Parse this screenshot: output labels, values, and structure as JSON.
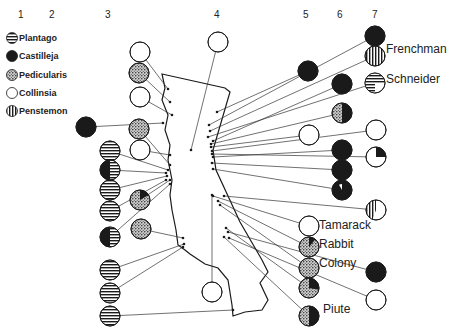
{
  "column_numbers": [
    {
      "label": "1",
      "x": 18,
      "y": 9
    },
    {
      "label": "2",
      "x": 49,
      "y": 9
    },
    {
      "label": "3",
      "x": 105,
      "y": 9
    },
    {
      "label": "4",
      "x": 214,
      "y": 9
    },
    {
      "label": "5",
      "x": 303,
      "y": 9
    },
    {
      "label": "6",
      "x": 337,
      "y": 9
    },
    {
      "label": "7",
      "x": 372,
      "y": 9
    }
  ],
  "legend": [
    {
      "label": "Plantago",
      "pattern": "hlines",
      "y": 34
    },
    {
      "label": "Castilleja",
      "pattern": "solid",
      "y": 52
    },
    {
      "label": "Pedicularis",
      "pattern": "dots",
      "y": 71
    },
    {
      "label": "Collinsia",
      "pattern": "empty",
      "y": 89
    },
    {
      "label": "Penstemon",
      "pattern": "vlines",
      "y": 107
    }
  ],
  "site_labels": [
    {
      "label": "Frenchman",
      "x": 386,
      "y": 50
    },
    {
      "label": "Schneider",
      "x": 386,
      "y": 80
    },
    {
      "label": "Tamarack",
      "x": 319,
      "y": 226
    },
    {
      "label": "Rabbit",
      "x": 319,
      "y": 245
    },
    {
      "label": "Colony",
      "x": 319,
      "y": 264
    },
    {
      "label": "Piute",
      "x": 323,
      "y": 310
    }
  ],
  "colors": {
    "ink": "#1a1a1a",
    "paper": "#ffffff"
  },
  "circles": [
    {
      "id": "c1-1",
      "cx": 86,
      "cy": 127,
      "r": 10,
      "pattern": "solid",
      "target": [
        163,
        123
      ]
    },
    {
      "id": "c3-1",
      "cx": 140,
      "cy": 52,
      "r": 10,
      "pattern": "empty",
      "target": [
        168,
        89
      ]
    },
    {
      "id": "c3-2",
      "cx": 139,
      "cy": 73,
      "r": 10,
      "pattern": "dots",
      "target": [
        170,
        102
      ]
    },
    {
      "id": "c3-3",
      "cx": 140,
      "cy": 97,
      "r": 10,
      "pattern": "empty",
      "target": [
        172,
        115
      ]
    },
    {
      "id": "c3-4",
      "cx": 139,
      "cy": 129,
      "r": 10,
      "pattern": "dots",
      "target": [
        170,
        165
      ]
    },
    {
      "id": "c3-5",
      "cx": 140,
      "cy": 150,
      "r": 10,
      "pattern": "empty",
      "target": [
        170,
        155
      ]
    },
    {
      "id": "c3-6",
      "cx": 140,
      "cy": 200,
      "r": 10,
      "pattern": "dots_wedge",
      "target": [
        170,
        180
      ]
    },
    {
      "id": "c3-7",
      "cx": 141,
      "cy": 229,
      "r": 10,
      "pattern": "dots",
      "target": [
        183,
        238
      ]
    },
    {
      "id": "c2-1",
      "cx": 110,
      "cy": 151,
      "r": 10,
      "pattern": "hlines",
      "target": [
        168,
        170
      ]
    },
    {
      "id": "c2-2",
      "cx": 110,
      "cy": 170,
      "r": 10,
      "pattern": "solid_hlines",
      "target": [
        166,
        173
      ]
    },
    {
      "id": "c2-3",
      "cx": 110,
      "cy": 190,
      "r": 10,
      "pattern": "hlines",
      "target": [
        167,
        176
      ]
    },
    {
      "id": "c2-4",
      "cx": 110,
      "cy": 211,
      "r": 10,
      "pattern": "hlines",
      "target": [
        166,
        180
      ]
    },
    {
      "id": "c2-5",
      "cx": 110,
      "cy": 237,
      "r": 10,
      "pattern": "solid_quarter_hlines",
      "target": [
        170,
        184
      ]
    },
    {
      "id": "c2-6",
      "cx": 110,
      "cy": 270,
      "r": 10,
      "pattern": "hlines",
      "target": [
        184,
        244
      ]
    },
    {
      "id": "c2-7",
      "cx": 110,
      "cy": 293,
      "r": 10,
      "pattern": "hlines",
      "target": [
        183,
        247
      ]
    },
    {
      "id": "c2-8",
      "cx": 110,
      "cy": 316,
      "r": 10,
      "pattern": "hlines",
      "target": [
        233,
        310
      ]
    },
    {
      "id": "c4-1",
      "cx": 218,
      "cy": 42,
      "r": 10,
      "pattern": "empty",
      "target": [
        191,
        150
      ]
    },
    {
      "id": "c4-2",
      "cx": 212,
      "cy": 292,
      "r": 10,
      "pattern": "empty",
      "target": [
        212,
        195
      ]
    },
    {
      "id": "c5-1",
      "cx": 308,
      "cy": 71,
      "r": 10,
      "pattern": "solid",
      "target": [
        217,
        112
      ]
    },
    {
      "id": "c5-2",
      "cx": 309,
      "cy": 135,
      "r": 10,
      "pattern": "empty",
      "target": [
        211,
        147
      ]
    },
    {
      "id": "c5-3",
      "cx": 309,
      "cy": 226,
      "r": 10,
      "pattern": "empty",
      "target": [
        213,
        196
      ]
    },
    {
      "id": "c5-4",
      "cx": 309,
      "cy": 247,
      "r": 10,
      "pattern": "dots_wedge_small",
      "target": [
        218,
        201
      ]
    },
    {
      "id": "c5-5",
      "cx": 309,
      "cy": 268,
      "r": 10,
      "pattern": "dots",
      "target": [
        220,
        205
      ]
    },
    {
      "id": "c5-6",
      "cx": 309,
      "cy": 288,
      "r": 10,
      "pattern": "dots_solid_quarter",
      "target": [
        226,
        228
      ]
    },
    {
      "id": "c5-7",
      "cx": 309,
      "cy": 316,
      "r": 10,
      "pattern": "dots_solid_half",
      "target": [
        224,
        237
      ]
    },
    {
      "id": "c6-1",
      "cx": 342,
      "cy": 84,
      "r": 10,
      "pattern": "solid",
      "target": [
        213,
        141
      ]
    },
    {
      "id": "c6-2",
      "cx": 342,
      "cy": 113,
      "r": 10,
      "pattern": "dots_solid_half",
      "target": [
        211,
        144
      ]
    },
    {
      "id": "c6-3",
      "cx": 342,
      "cy": 150,
      "r": 10,
      "pattern": "solid",
      "target": [
        213,
        157
      ]
    },
    {
      "id": "c6-4",
      "cx": 342,
      "cy": 170,
      "r": 10,
      "pattern": "solid",
      "target": [
        212,
        163
      ]
    },
    {
      "id": "c6-5",
      "cx": 342,
      "cy": 190,
      "r": 10,
      "pattern": "solid_wedge_white",
      "target": [
        213,
        169
      ]
    },
    {
      "id": "c6-6",
      "cx": 376,
      "cy": 272,
      "r": 10,
      "pattern": "solid",
      "target": [
        228,
        232
      ]
    },
    {
      "id": "c6-7",
      "cx": 376,
      "cy": 300,
      "r": 10,
      "pattern": "empty",
      "target": [
        229,
        238
      ]
    },
    {
      "id": "c7-1",
      "cx": 375,
      "cy": 36,
      "r": 10,
      "pattern": "solid",
      "target": [
        209,
        125
      ]
    },
    {
      "id": "c7-2",
      "cx": 375,
      "cy": 56,
      "r": 10,
      "pattern": "vlines",
      "target": [
        210,
        131
      ]
    },
    {
      "id": "c7-3",
      "cx": 375,
      "cy": 83,
      "r": 10,
      "pattern": "hlines_partial",
      "target": [
        208,
        137
      ]
    },
    {
      "id": "c7-4",
      "cx": 376,
      "cy": 130,
      "r": 10,
      "pattern": "empty",
      "target": [
        212,
        151
      ]
    },
    {
      "id": "c7-5",
      "cx": 376,
      "cy": 157,
      "r": 10,
      "pattern": "empty_wedge_solid",
      "target": [
        212,
        154
      ]
    },
    {
      "id": "c7-6",
      "cx": 376,
      "cy": 210,
      "r": 10,
      "pattern": "vlines_partial",
      "target": [
        224,
        196
      ]
    }
  ]
}
